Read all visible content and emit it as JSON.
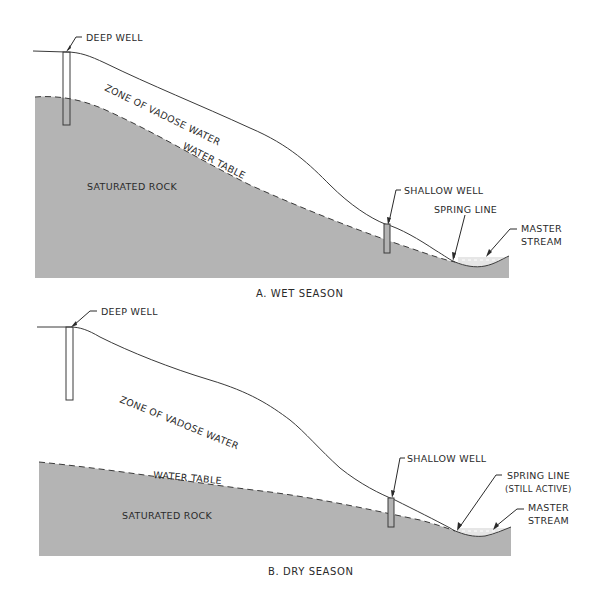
{
  "diagram": {
    "type": "cross-section",
    "colors": {
      "saturated_rock": "#b4b4b4",
      "line": "#3a3a3a",
      "text": "#2a2a2a",
      "background": "#ffffff",
      "stream": "#e4e4e4"
    },
    "panels": [
      {
        "id": "A",
        "caption": "A. WET SEASON",
        "labels": {
          "deep_well": "DEEP WELL",
          "zone_vadose": "ZONE OF VADOSE WATER",
          "water_table": "WATER TABLE",
          "saturated_rock": "SATURATED ROCK",
          "shallow_well": "SHALLOW WELL",
          "spring_line": "SPRING LINE",
          "master_stream_1": "MASTER",
          "master_stream_2": "STREAM"
        }
      },
      {
        "id": "B",
        "caption": "B. DRY SEASON",
        "labels": {
          "deep_well": "DEEP WELL",
          "zone_vadose": "ZONE OF VADOSE WATER",
          "water_table": "WATER TABLE",
          "saturated_rock": "SATURATED ROCK",
          "shallow_well": "SHALLOW WELL",
          "spring_line": "SPRING LINE",
          "spring_line_note": "(STILL ACTIVE)",
          "master_stream_1": "MASTER",
          "master_stream_2": "STREAM"
        }
      }
    ]
  }
}
